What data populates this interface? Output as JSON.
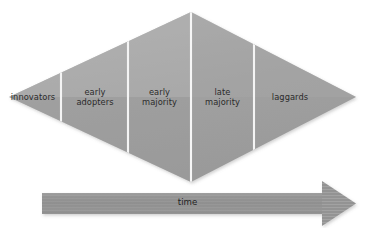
{
  "diagram": {
    "type": "diffusion-of-innovations-rhombus",
    "canvas": {
      "width": 375,
      "height": 228,
      "background": "#ffffff"
    },
    "shape": {
      "name": "rhombus",
      "fill": "#9d9d9d",
      "fill_light": "#b4b4b4",
      "divider_color": "#ffffff",
      "left_tip_x": 9,
      "right_tip_x": 356,
      "top_apex_y": 12,
      "bottom_vertex_y": 182,
      "center_x": 191,
      "center_y": 97
    },
    "segments": [
      {
        "id": "innovators",
        "label": "innovators",
        "divider_x": 9
      },
      {
        "id": "early-adopters",
        "label": "early\nadopters",
        "divider_x": 61
      },
      {
        "id": "early-majority",
        "label": "early\nmajority",
        "divider_x": 128
      },
      {
        "id": "late-majority",
        "label": "late\nmajority",
        "divider_x": 191
      },
      {
        "id": "laggards",
        "label": "laggards",
        "divider_x": 254
      }
    ],
    "axis_arrow": {
      "label": "time",
      "color": "#8e8e8e",
      "stripe_color": "#a3a3a3",
      "start_x": 42,
      "end_x": 356,
      "top_y": 193,
      "bottom_y": 214,
      "head_width": 34,
      "head_half_height": 16
    },
    "text_color": "#2b2b2b"
  }
}
